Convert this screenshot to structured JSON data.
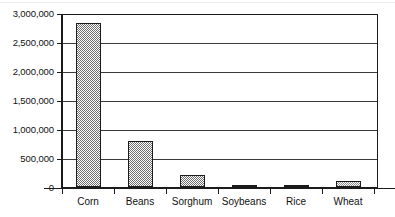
{
  "chart_data": {
    "type": "bar",
    "title": "",
    "subtitle": "",
    "xlabel": "",
    "ylabel": "",
    "categories": [
      "Corn",
      "Beans",
      "Sorghum",
      "Soybeans",
      "Rice",
      "Wheat"
    ],
    "values": [
      2820000,
      790000,
      200000,
      25000,
      30000,
      105000
    ],
    "series": [
      {
        "name": "",
        "values": [
          2820000,
          790000,
          200000,
          25000,
          30000,
          105000
        ]
      }
    ],
    "ylim": [
      0,
      3000000
    ],
    "ytick_values": [
      0,
      500000,
      1000000,
      1500000,
      2000000,
      2500000,
      3000000
    ],
    "ytick_labels": [
      "0",
      "500,000",
      "1,000,000",
      "1,500,000",
      "2,000,000",
      "2,500,000",
      "3,000,000"
    ],
    "grid": true,
    "grid_axis": "y",
    "legend": false,
    "legend_position": "none",
    "bar_fill": "checkered-halftone",
    "annotations": []
  },
  "colors": {
    "background": "#ffffff",
    "axis": "#1b1b1b",
    "grid": "#3a3a3a",
    "bar_fill": "#6f6f6f",
    "bar_fill_light": "#8d8d8d",
    "bar_fill_solid": "#1b1b1b",
    "text": "#111111"
  }
}
